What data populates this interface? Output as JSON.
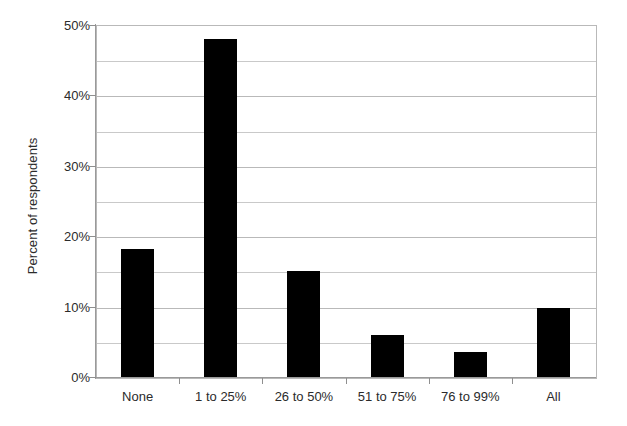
{
  "chart_data": {
    "type": "bar",
    "title": "",
    "subtitle": "",
    "xlabel": "",
    "ylabel": "Percent of respondents",
    "categories": [
      "None",
      "1 to 25%",
      "26 to 50%",
      "51 to 75%",
      "76 to 99%",
      "All"
    ],
    "values": [
      18.2,
      48.0,
      15.0,
      5.9,
      3.6,
      9.8
    ],
    "series": [
      {
        "name": "Percent of respondents",
        "values": [
          18.2,
          48.0,
          15.0,
          5.9,
          3.6,
          9.8
        ]
      }
    ],
    "ylim": [
      0,
      50
    ],
    "ytick_values": [
      0,
      5,
      10,
      15,
      20,
      25,
      30,
      35,
      40,
      45,
      50
    ],
    "ytick_labels": [
      "0%",
      "",
      "10%",
      "",
      "20%",
      "",
      "30%",
      "",
      "40%",
      "",
      "50%"
    ],
    "ytick_major_labels": [
      "0%",
      "10%",
      "20%",
      "30%",
      "40%",
      "50%"
    ],
    "ytick_major_values": [
      0,
      10,
      20,
      30,
      40,
      50
    ],
    "grid": true,
    "grid_axis": "y",
    "grid_interval": 5,
    "legend": false,
    "legend_position": "none",
    "bar_color": "#000000",
    "grid_color": "#b9b9b9",
    "axis_color": "#8f8f8f",
    "background_color": "#ffffff",
    "annotations": []
  },
  "figure": {
    "y_axis_title": "Percent of respondents"
  }
}
